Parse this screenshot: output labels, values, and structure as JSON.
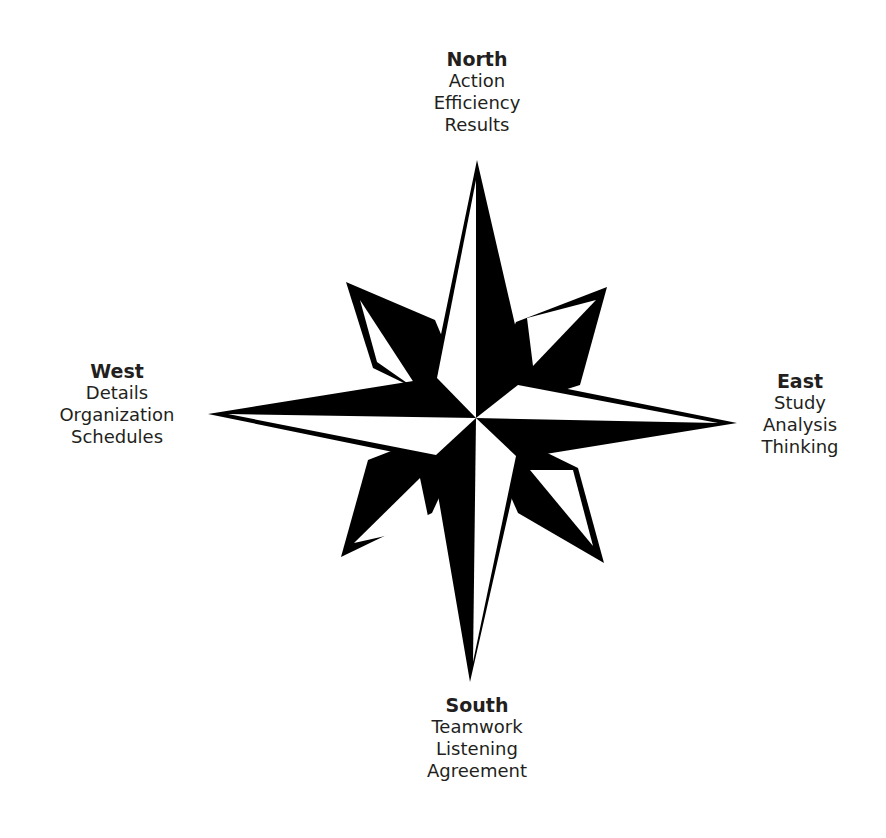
{
  "diagram": {
    "type": "compass-rose",
    "colors": {
      "fill": "#000000",
      "background": "#ffffff",
      "text": "#231f20"
    },
    "directions": {
      "north": {
        "title": "North",
        "items": [
          "Action",
          "Efficiency",
          "Results"
        ]
      },
      "east": {
        "title": "East",
        "items": [
          "Study",
          "Analysis",
          "Thinking"
        ]
      },
      "south": {
        "title": "South",
        "items": [
          "Teamwork",
          "Listening",
          "Agreement"
        ]
      },
      "west": {
        "title": "West",
        "items": [
          "Details",
          "Organization",
          "Schedules"
        ]
      }
    }
  }
}
